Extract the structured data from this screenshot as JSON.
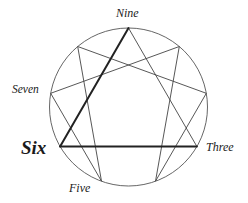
{
  "diagram": {
    "type": "enneagram",
    "colors": {
      "stroke": "#333333",
      "label": "#1a1a1a",
      "background": "#ffffff"
    },
    "labels": {
      "nine": "Nine",
      "seven": "Seven",
      "six": "Six",
      "three": "Three",
      "five": "Five"
    },
    "emphasized_label": "Six",
    "circle": {
      "cx": 128.5,
      "cy": 107,
      "r": 79
    },
    "points": {
      "9": [
        128.5,
        28
      ],
      "1": [
        179.3,
        46.5
      ],
      "2": [
        206.3,
        93.3
      ],
      "3": [
        196.9,
        146.5
      ],
      "4": [
        155.5,
        181.2
      ],
      "5": [
        101.5,
        181.2
      ],
      "6": [
        60.1,
        146.5
      ],
      "7": [
        50.7,
        93.3
      ],
      "8": [
        77.7,
        46.5
      ]
    },
    "thick_edges": [
      [
        "9",
        "6"
      ],
      [
        "6",
        "3"
      ]
    ],
    "thin_edges": [
      [
        "3",
        "9"
      ],
      [
        "1",
        "4"
      ],
      [
        "4",
        "2"
      ],
      [
        "2",
        "8"
      ],
      [
        "8",
        "5"
      ],
      [
        "5",
        "7"
      ],
      [
        "7",
        "1"
      ]
    ]
  }
}
